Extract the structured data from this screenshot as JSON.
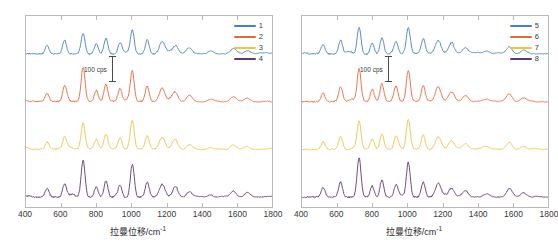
{
  "figure": {
    "panels": [
      {
        "id": "panel-left",
        "xlabel": "拉曼位移/cm",
        "xlabel_sup": "-1",
        "scalebar_text": "100 cps",
        "legend": [
          {
            "label": "1",
            "color": "#4a7ebb"
          },
          {
            "label": "2",
            "color": "#e8663c"
          },
          {
            "label": "3",
            "color": "#f0c14b"
          },
          {
            "label": "4",
            "color": "#5b3a6e"
          }
        ],
        "xticks": [
          "400",
          "600",
          "800",
          "1000",
          "1200",
          "1400",
          "1600",
          "1800"
        ]
      },
      {
        "id": "panel-right",
        "xlabel": "拉曼位移/cm",
        "xlabel_sup": "-1",
        "scalebar_text": "100 cps",
        "legend": [
          {
            "label": "5",
            "color": "#4a7ebb"
          },
          {
            "label": "6",
            "color": "#e8663c"
          },
          {
            "label": "7",
            "color": "#f0c14b"
          },
          {
            "label": "8",
            "color": "#5b3a6e"
          }
        ],
        "xticks": [
          "400",
          "600",
          "800",
          "1000",
          "1200",
          "1400",
          "1600",
          "1800"
        ]
      }
    ]
  },
  "chart_data": {
    "type": "line",
    "title": "",
    "subtitle": "",
    "xlabel": "拉曼位移/cm-1",
    "ylabel": "",
    "xlim": [
      400,
      1800
    ],
    "ylim": [
      0,
      4
    ],
    "grid": false,
    "legend_position": "top-right",
    "scalebar": {
      "value": 100,
      "unit": "cps",
      "label": "100 cps"
    },
    "panels": [
      {
        "name": "panel-left",
        "legend_entries": [
          "1",
          "2",
          "3",
          "4"
        ],
        "colors": [
          "#4a7ebb",
          "#e8663c",
          "#f0c14b",
          "#5b3a6e"
        ],
        "x_ticks": [
          400,
          600,
          800,
          1000,
          1200,
          1400,
          1600,
          1800
        ],
        "series": [
          {
            "name": "1",
            "color": "#4a7ebb",
            "offset": 3,
            "peaks_cm1": [
              520,
              620,
              725,
              800,
              855,
              935,
              1005,
              1090,
              1175,
              1250,
              1330,
              1450,
              1580,
              1660
            ],
            "peak_intensities": [
              30,
              45,
              70,
              35,
              55,
              40,
              85,
              50,
              45,
              30,
              35,
              25,
              30,
              20
            ],
            "baseline_noise": 8
          },
          {
            "name": "2",
            "color": "#e8663c",
            "offset": 2,
            "peaks_cm1": [
              520,
              620,
              725,
              800,
              855,
              935,
              1005,
              1090,
              1175,
              1250,
              1330,
              1450,
              1580,
              1660
            ],
            "peak_intensities": [
              28,
              50,
              120,
              40,
              60,
              45,
              105,
              55,
              48,
              32,
              38,
              28,
              35,
              22
            ],
            "baseline_noise": 8
          },
          {
            "name": "3",
            "color": "#f0c14b",
            "offset": 1,
            "peaks_cm1": [
              520,
              620,
              725,
              800,
              855,
              935,
              1005,
              1090,
              1175,
              1250,
              1330,
              1450,
              1580,
              1660
            ],
            "peak_intensities": [
              25,
              42,
              90,
              33,
              52,
              38,
              95,
              48,
              42,
              28,
              33,
              24,
              30,
              18
            ],
            "baseline_noise": 7
          },
          {
            "name": "4",
            "color": "#5b3a6e",
            "offset": 0,
            "peaks_cm1": [
              520,
              620,
              725,
              800,
              855,
              935,
              1005,
              1090,
              1175,
              1250,
              1330,
              1450,
              1580,
              1660
            ],
            "peak_intensities": [
              30,
              48,
              130,
              38,
              58,
              42,
              115,
              52,
              45,
              30,
              36,
              26,
              40,
              24
            ],
            "baseline_noise": 9
          }
        ]
      },
      {
        "name": "panel-right",
        "legend_entries": [
          "5",
          "6",
          "7",
          "8"
        ],
        "colors": [
          "#4a7ebb",
          "#e8663c",
          "#f0c14b",
          "#5b3a6e"
        ],
        "x_ticks": [
          400,
          600,
          800,
          1000,
          1200,
          1400,
          1600,
          1800
        ],
        "series": [
          {
            "name": "5",
            "color": "#4a7ebb",
            "offset": 3,
            "peaks_cm1": [
              520,
              620,
              725,
              800,
              855,
              935,
              1005,
              1090,
              1175,
              1250,
              1330,
              1450,
              1580,
              1660
            ],
            "peak_intensities": [
              32,
              48,
              95,
              38,
              58,
              42,
              90,
              52,
              46,
              32,
              36,
              26,
              45,
              22
            ],
            "baseline_noise": 8
          },
          {
            "name": "6",
            "color": "#e8663c",
            "offset": 2,
            "peaks_cm1": [
              520,
              620,
              725,
              800,
              855,
              935,
              1005,
              1090,
              1175,
              1250,
              1330,
              1450,
              1580,
              1660
            ],
            "peak_intensities": [
              30,
              52,
              115,
              42,
              62,
              46,
              110,
              56,
              50,
              34,
              40,
              30,
              48,
              25
            ],
            "baseline_noise": 8
          },
          {
            "name": "7",
            "color": "#f0c14b",
            "offset": 1,
            "peaks_cm1": [
              520,
              620,
              725,
              800,
              855,
              935,
              1005,
              1090,
              1175,
              1250,
              1330,
              1450,
              1580,
              1660
            ],
            "peak_intensities": [
              27,
              45,
              100,
              36,
              55,
              40,
              105,
              50,
              44,
              30,
              35,
              26,
              42,
              20
            ],
            "baseline_noise": 7
          },
          {
            "name": "8",
            "color": "#5b3a6e",
            "offset": 0,
            "peaks_cm1": [
              520,
              620,
              725,
              800,
              855,
              935,
              1005,
              1090,
              1175,
              1250,
              1330,
              1450,
              1580,
              1660
            ],
            "peak_intensities": [
              33,
              50,
              135,
              40,
              60,
              44,
              125,
              54,
              47,
              31,
              38,
              28,
              50,
              26
            ],
            "baseline_noise": 9
          }
        ]
      }
    ]
  }
}
